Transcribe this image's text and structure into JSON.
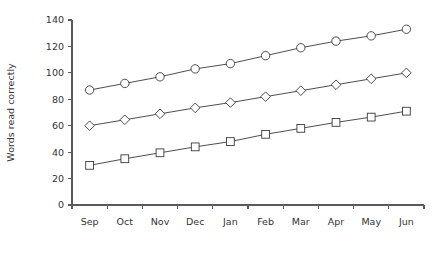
{
  "chart_data": {
    "type": "line",
    "title": "",
    "xlabel": "",
    "ylabel": "Words read correctly",
    "categories": [
      "Sep",
      "Oct",
      "Nov",
      "Dec",
      "Jan",
      "Feb",
      "Mar",
      "Apr",
      "May",
      "Jun"
    ],
    "ylim": [
      0,
      140
    ],
    "yticks": [
      0,
      20,
      40,
      60,
      80,
      100,
      120,
      140
    ],
    "grid": false,
    "legend": "none",
    "series": [
      {
        "name": "circle-series",
        "marker": "circle",
        "values": [
          87,
          92,
          97,
          103,
          107,
          113,
          119,
          124,
          128,
          133
        ]
      },
      {
        "name": "diamond-series",
        "marker": "diamond",
        "values": [
          60,
          64.5,
          69,
          73.5,
          77.5,
          82,
          86.5,
          91,
          95.5,
          100
        ]
      },
      {
        "name": "square-series",
        "marker": "square",
        "values": [
          30,
          35,
          39.5,
          44,
          48,
          53.5,
          58,
          62.5,
          66.5,
          71
        ]
      }
    ]
  }
}
